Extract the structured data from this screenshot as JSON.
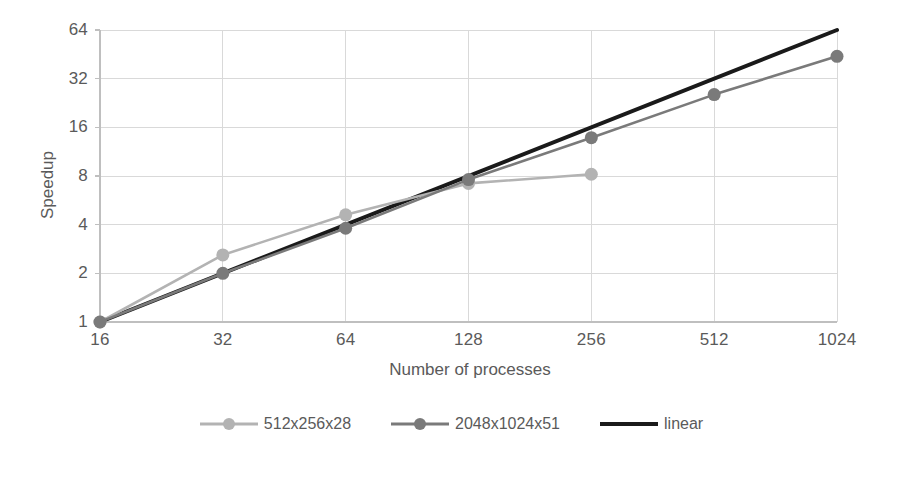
{
  "chart_data": {
    "type": "line",
    "title": "",
    "xlabel": "Number of processes",
    "ylabel": "Speedup",
    "x_scale": "log2",
    "y_scale": "log2",
    "x_categories": [
      16,
      32,
      64,
      128,
      256,
      512,
      1024
    ],
    "x_tick_labels": [
      "16",
      "32",
      "64",
      "128",
      "256",
      "512",
      "1024"
    ],
    "y_tick_values": [
      1,
      2,
      4,
      8,
      16,
      32,
      64
    ],
    "y_tick_labels": [
      "1",
      "2",
      "4",
      "8",
      "16",
      "32",
      "64"
    ],
    "xlim": [
      16,
      1024
    ],
    "ylim": [
      1,
      64
    ],
    "grid": true,
    "legend_position": "bottom",
    "series": [
      {
        "name": "512x256x28",
        "color": "#b3b3b3",
        "marker": "circle",
        "x": [
          16,
          32,
          64,
          128,
          256
        ],
        "values": [
          1,
          2.6,
          4.6,
          7.2,
          8.2
        ]
      },
      {
        "name": "2048x1024x51",
        "color": "#7a7a7a",
        "marker": "circle",
        "x": [
          16,
          32,
          64,
          128,
          256,
          512,
          1024
        ],
        "values": [
          1,
          2.0,
          3.8,
          7.6,
          13.8,
          25.5,
          44
        ]
      },
      {
        "name": "linear",
        "color": "#1a1a1a",
        "marker": "none",
        "x": [
          16,
          1024
        ],
        "values": [
          1,
          64
        ]
      }
    ]
  },
  "axis": {
    "y_title": "Speedup",
    "x_title": "Number of processes"
  },
  "legend": {
    "items": [
      {
        "label": "512x256x28",
        "color": "#b3b3b3",
        "has_marker": true
      },
      {
        "label": "2048x1024x51",
        "color": "#7a7a7a",
        "has_marker": true
      },
      {
        "label": "linear",
        "color": "#1a1a1a",
        "has_marker": false
      }
    ]
  },
  "colors": {
    "series_light": "#b3b3b3",
    "series_dark": "#7a7a7a",
    "series_linear": "#1a1a1a",
    "grid": "#d9d9d9",
    "axis": "#bfbfbf",
    "text": "#5a5a5a",
    "background": "#ffffff"
  }
}
